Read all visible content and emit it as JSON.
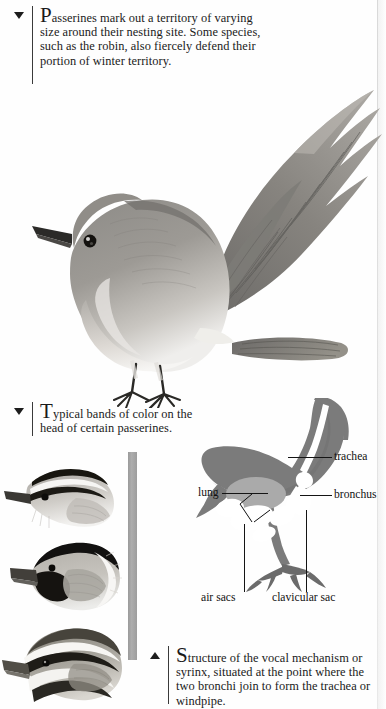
{
  "page": {
    "background_color": "#fefefe",
    "text_color": "#1a1a1a"
  },
  "captions": {
    "territory": {
      "marker": "triangle-down",
      "dropcap": "P",
      "body": "asserines mark out a territory of varying size around their nesting site. Some species, such as the robin, also fiercely defend their portion of winter territory."
    },
    "bands": {
      "marker": "triangle-down",
      "dropcap": "T",
      "body": "ypical bands of color on the head of certain passerines."
    },
    "syrinx": {
      "marker": "triangle-up",
      "dropcap": "S",
      "body": "tructure of the vocal mechanism or syrinx, situated at the point where the two bronchi join to form the trachea or windpipe."
    }
  },
  "figures": {
    "robin": {
      "name": "robin-with-raised-wing",
      "alt": "Grayscale illustration of a perched robin with one wing raised"
    },
    "heads": [
      {
        "name": "head-striped-crown",
        "alt": "Passerine head with black and white crown stripes"
      },
      {
        "name": "head-black-cap",
        "alt": "Passerine head with black cap and white cheek band"
      },
      {
        "name": "head-eye-stripe",
        "alt": "Passerine head with bold white supercilium and dark eye stripe"
      }
    ],
    "anatomy": {
      "name": "syrinx-anatomy-silhouette",
      "alt": "Gray bird silhouette showing trachea, bronchi, lung, air sacs and clavicular sac",
      "silhouette_color": "#7b7b7b",
      "lung_color": "#a9a9a9",
      "organ_color": "#ffffff"
    }
  },
  "anatomy_labels": {
    "trachea": "trachea",
    "bronchus": "bronchus",
    "lung": "lung",
    "air_sacs": "air sacs",
    "clavicular_sac": "clavicular sac"
  },
  "divider": {
    "name": "vertical-gray-bar",
    "color": "#a3a3a3"
  }
}
